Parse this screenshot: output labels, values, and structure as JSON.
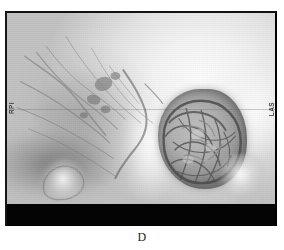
{
  "figure": {
    "panel_letter": "D",
    "modality": "3D CT volume rendering",
    "view": "lateral skull",
    "background_color": "#ffffff",
    "frame_color": "#040404",
    "tissue_light": "#f7f7f7",
    "tissue_mid": "#bdbdbd",
    "tissue_dark": "#6e6e6e"
  },
  "scan": {
    "orientation_labels": {
      "left": "RPI",
      "right": "LAS"
    },
    "black_band_present": true,
    "reference_line_present": true
  },
  "annotations": {
    "mass_label": "",
    "vessel_network_label": ""
  }
}
